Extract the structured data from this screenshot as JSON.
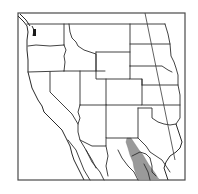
{
  "map": {
    "type": "species-range-map",
    "region": "Western United States and northern Mexico",
    "style": "grayscale line map",
    "colors": {
      "background": "#ffffff",
      "frame": "#4a4a4a",
      "boundary": "#2e2e2e",
      "range_fill": "#9a9a9a"
    },
    "layers": [
      {
        "name": "state-boundaries",
        "visible": true
      },
      {
        "name": "meridian-line",
        "visible": true
      },
      {
        "name": "species-range",
        "visible": true,
        "location": "Chihuahua / Sierra Madre Occidental, extending into far west Texas / southern New Mexico"
      }
    ],
    "labels": []
  }
}
